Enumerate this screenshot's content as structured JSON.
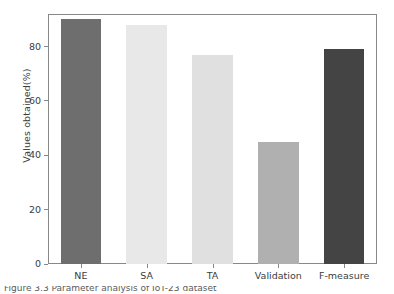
{
  "chart_data": {
    "type": "bar",
    "title": "",
    "xlabel": "",
    "ylabel": "Values obtained(%)",
    "categories": [
      "NE",
      "SA",
      "TA",
      "Validation",
      "F-measure"
    ],
    "values": [
      90,
      88,
      77,
      45,
      79
    ],
    "bar_colors": [
      "#6e6e6e",
      "#e8e8e8",
      "#e0e0e0",
      "#b0b0b0",
      "#444444"
    ],
    "ylim": [
      0,
      92
    ],
    "yticks": [
      0,
      20,
      40,
      60,
      80
    ],
    "ytick_labels": [
      "0",
      "20",
      "40",
      "60",
      "80"
    ],
    "grid": false,
    "legend": null,
    "frame": "box",
    "axis_color": "#888888"
  },
  "caption": {
    "text": "Figure 3.3  Parameter analysis of IoT-23 dataset",
    "clipped": true
  }
}
